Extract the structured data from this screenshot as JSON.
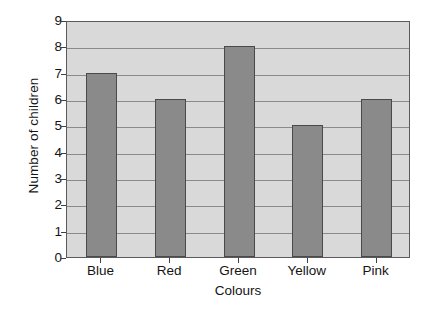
{
  "chart_data": {
    "type": "bar",
    "title": "",
    "xlabel": "Colours",
    "ylabel": "Number of children",
    "categories": [
      "Blue",
      "Red",
      "Green",
      "Yellow",
      "Pink"
    ],
    "values": [
      7,
      6,
      8,
      5,
      6
    ],
    "ylim": [
      0,
      9
    ],
    "yticks": [
      0,
      1,
      2,
      3,
      4,
      5,
      6,
      7,
      8,
      9
    ],
    "ytick_labels": [
      "0",
      "1",
      "2",
      "3",
      "4",
      "5",
      "6",
      "7",
      "8",
      "9"
    ],
    "grid": true,
    "grid_axis": "y",
    "legend": false,
    "bar_color": "#8a8a8a",
    "bar_edge_color": "#4a4a4a",
    "plot_background": "#d9d9d9",
    "gridline_color": "#8a8a8a",
    "axis_color": "#5a5a5a",
    "page_background": "#ffffff"
  }
}
